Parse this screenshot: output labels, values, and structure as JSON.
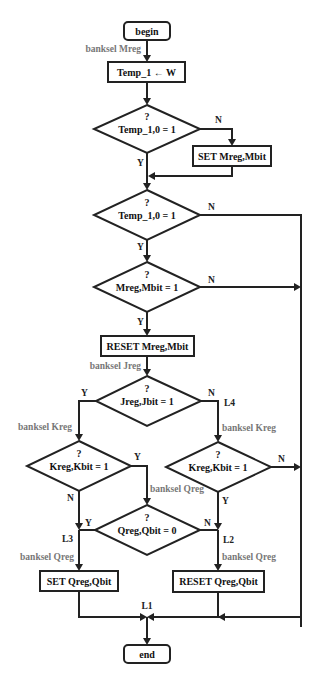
{
  "flowchart": {
    "terminals": {
      "begin": "begin",
      "end": "end"
    },
    "processes": {
      "temp_assign": "Temp_1 ← W",
      "set_mreg": "SET Mreg,Mbit",
      "reset_mreg": "RESET Mreg,Mbit",
      "set_qreg": "SET Qreg,Qbit",
      "reset_qreg": "RESET Qreg,Qbit"
    },
    "decisions": {
      "d1": {
        "question": "?",
        "condition": "Temp_1,0 = 1"
      },
      "d2": {
        "question": "?",
        "condition": "Temp_1,0 = 1"
      },
      "d3": {
        "question": "?",
        "condition": "Mreg,Mbit = 1"
      },
      "d4": {
        "question": "?",
        "condition": "Jreg,Jbit  = 1"
      },
      "d5": {
        "question": "?",
        "condition": "Kreg,Kbit  = 1"
      },
      "d6": {
        "question": "?",
        "condition": "Kreg,Kbit  = 1"
      },
      "d7": {
        "question": "?",
        "condition": "Qreg,Qbit  = 0"
      }
    },
    "annotations": {
      "banksel_mreg": "banksel Mreg",
      "banksel_jreg": "banksel Jreg",
      "banksel_kreg_left": "banksel Kreg",
      "banksel_kreg_right": "banksel Kreg",
      "banksel_qreg_mid": "banksel Qreg",
      "banksel_qreg_left": "banksel Qreg",
      "banksel_qreg_right": "banksel Qreg"
    },
    "branch_labels": {
      "yes": "Y",
      "no": "N"
    },
    "jump_labels": {
      "l1": "L1",
      "l2": "L2",
      "l3": "L3",
      "l4": "L4"
    }
  }
}
